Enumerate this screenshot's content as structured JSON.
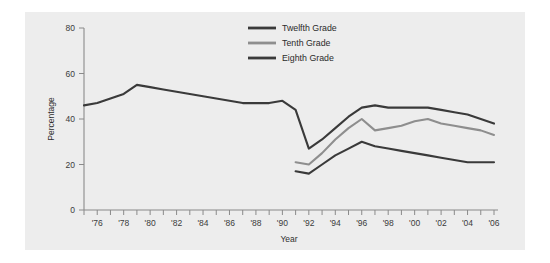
{
  "chart_data": {
    "type": "line",
    "title": "",
    "xlabel": "Year",
    "ylabel": "Percentage",
    "xlim": [
      1975,
      2006
    ],
    "ylim": [
      0,
      80
    ],
    "yticks": [
      0,
      20,
      40,
      60,
      80
    ],
    "ytick_labels": [
      "0",
      "20",
      "40",
      "60",
      "80"
    ],
    "xticks": [
      1975,
      1976,
      1977,
      1978,
      1979,
      1980,
      1981,
      1982,
      1983,
      1984,
      1985,
      1986,
      1987,
      1988,
      1989,
      1990,
      1991,
      1992,
      1993,
      1994,
      1995,
      1996,
      1997,
      1998,
      1999,
      2000,
      2001,
      2002,
      2003,
      2004,
      2005,
      2006
    ],
    "xtick_labels": [
      "",
      "'76",
      "",
      "'78",
      "",
      "'80",
      "",
      "'82",
      "",
      "'84",
      "",
      "'86",
      "",
      "'88",
      "",
      "'90",
      "",
      "'92",
      "",
      "'94",
      "",
      "'96",
      "",
      "'98",
      "",
      "'00",
      "",
      "'02",
      "",
      "'04",
      "",
      "'06"
    ],
    "grid": false,
    "legend_position": "top-center",
    "background_color": "#ededed",
    "series": [
      {
        "name": "Twelfth Grade",
        "color": "#3a3a3a",
        "x": [
          1975,
          1976,
          1977,
          1978,
          1979,
          1980,
          1981,
          1982,
          1983,
          1984,
          1985,
          1986,
          1987,
          1988,
          1989,
          1990,
          1991,
          1992,
          1993,
          1994,
          1995,
          1996,
          1997,
          1998,
          1999,
          2000,
          2001,
          2002,
          2003,
          2004,
          2005,
          2006
        ],
        "values": [
          46,
          47,
          49,
          51,
          55,
          54,
          53,
          52,
          51,
          50,
          49,
          48,
          47,
          47,
          47,
          48,
          44,
          27,
          31,
          36,
          41,
          45,
          46,
          45,
          45,
          45,
          45,
          44,
          43,
          42,
          40,
          38
        ]
      },
      {
        "name": "Tenth Grade",
        "color": "#8e8e8e",
        "x": [
          1991,
          1992,
          1993,
          1994,
          1995,
          1996,
          1997,
          1998,
          1999,
          2000,
          2001,
          2002,
          2003,
          2004,
          2005,
          2006
        ],
        "values": [
          21,
          20,
          25,
          31,
          36,
          40,
          35,
          36,
          37,
          39,
          40,
          38,
          37,
          36,
          35,
          33
        ]
      },
      {
        "name": "Eighth Grade",
        "color": "#3a3a3a",
        "x": [
          1991,
          1992,
          1993,
          1994,
          1995,
          1996,
          1997,
          1998,
          1999,
          2000,
          2001,
          2002,
          2003,
          2004,
          2005,
          2006
        ],
        "values": [
          17,
          16,
          20,
          24,
          27,
          30,
          28,
          27,
          26,
          25,
          24,
          23,
          22,
          21,
          21,
          21
        ]
      }
    ]
  },
  "legend": {
    "items": [
      {
        "label": "Twelfth Grade"
      },
      {
        "label": "Tenth Grade"
      },
      {
        "label": "Eighth Grade"
      }
    ]
  },
  "axes": {
    "x_title": "Year",
    "y_title": "Percentage"
  }
}
